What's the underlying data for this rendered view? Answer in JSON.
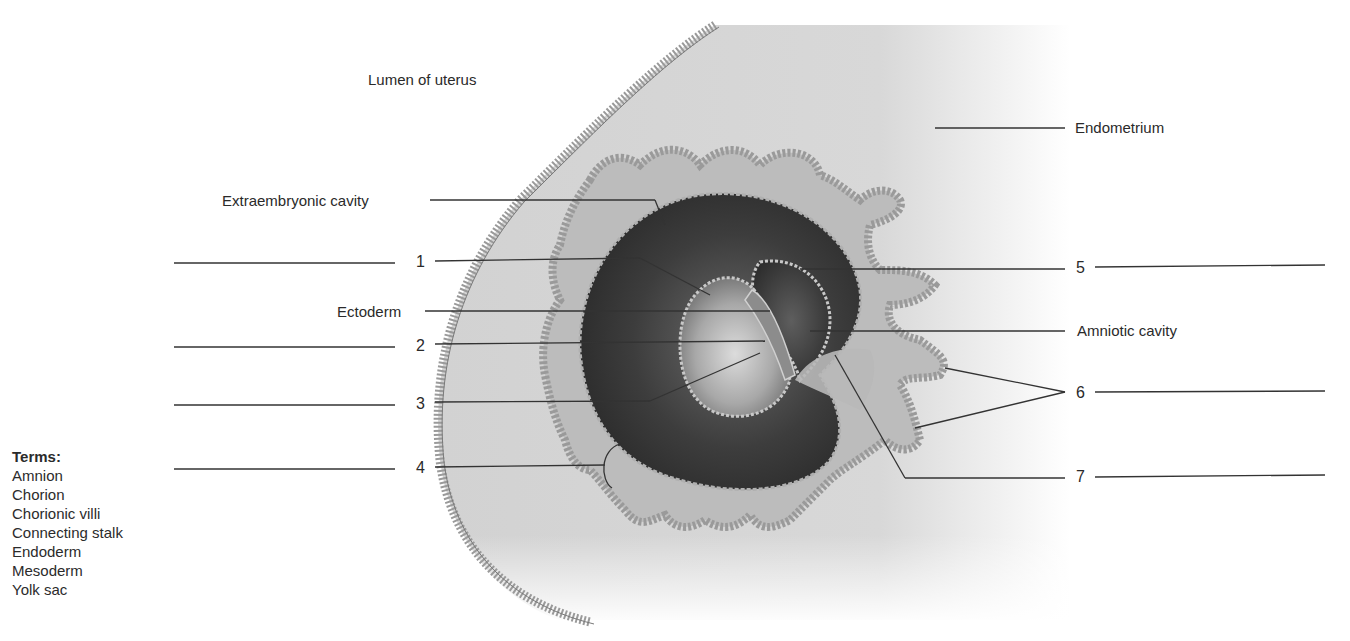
{
  "figure": {
    "static_labels": {
      "lumen": "Lumen of uterus",
      "endometrium": "Endometrium",
      "extraembryonic_cavity": "Extraembryonic cavity",
      "ectoderm": "Ectoderm",
      "amniotic_cavity": "Amniotic cavity"
    },
    "numbered_labels": [
      {
        "num": "1",
        "side": "left"
      },
      {
        "num": "2",
        "side": "left"
      },
      {
        "num": "3",
        "side": "left"
      },
      {
        "num": "4",
        "side": "left"
      },
      {
        "num": "5",
        "side": "right"
      },
      {
        "num": "6",
        "side": "right"
      },
      {
        "num": "7",
        "side": "right"
      }
    ]
  },
  "terms": {
    "title": "Terms:",
    "items": [
      "Amnion",
      "Chorion",
      "Chorionic villi",
      "Connecting stalk",
      "Endoderm",
      "Mesoderm",
      "Yolk sac"
    ]
  },
  "colors": {
    "text": "#2a2a2a",
    "tissue": "#d4d4d4",
    "cavity": "#3a3a3a",
    "leader_line": "#333333"
  }
}
